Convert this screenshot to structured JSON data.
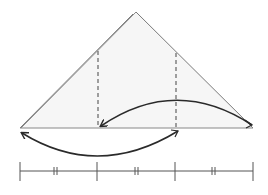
{
  "diagram": {
    "colors": {
      "triangle_fill": "#f6f6f6",
      "triangle_stroke": "#7a7a7a",
      "arrow_stroke": "#2a2a2a",
      "dash_stroke": "#444444",
      "segment_stroke": "#555555"
    },
    "triangle": {
      "apex": [
        136,
        12
      ],
      "apex_offset": [
        133,
        14
      ],
      "base_left": [
        20,
        128
      ],
      "base_right": [
        253,
        128
      ]
    },
    "fold_lines": [
      {
        "x": 98,
        "y_top": 51,
        "y_bottom": 128
      },
      {
        "x": 176,
        "y_top": 53,
        "y_bottom": 128
      }
    ],
    "arrows": [
      {
        "name": "upper-arc-arrow",
        "from": [
          252,
          125
        ],
        "to": [
          101,
          126
        ],
        "control": [
          176,
          75
        ]
      },
      {
        "name": "lower-arc-arrow",
        "from": [
          178,
          131
        ],
        "to": [
          22,
          133
        ],
        "control": [
          98,
          180
        ]
      }
    ],
    "segment": {
      "y": 171,
      "ticks_x": [
        20,
        97,
        175,
        253
      ],
      "equal_marks_x": [
        55,
        136,
        213
      ],
      "equal_mark_symbol": "||",
      "parts": 3
    }
  }
}
